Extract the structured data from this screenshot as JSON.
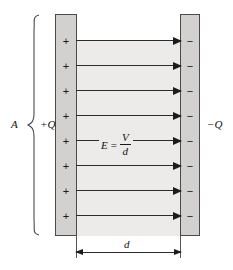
{
  "figure": {
    "type": "diagram",
    "background_color": "#ffffff"
  },
  "colors": {
    "plate_fill": "#d2d1cf",
    "plate_stroke": "#4a4a4a",
    "field_region_fill": "#edebe9",
    "line": "#2b2b2b",
    "text": "#111111"
  },
  "plates": {
    "positive": {
      "charge_label": "+Q",
      "charge_symbol": "+",
      "charge_count": 8,
      "area_label": "A"
    },
    "negative": {
      "charge_label": "−Q",
      "charge_symbol": "−",
      "charge_count": 8
    }
  },
  "field": {
    "arrow_count": 8,
    "direction": "left-to-right",
    "equation": {
      "symbol": "E",
      "operator": "=",
      "numerator": "V",
      "denominator": "d",
      "full_text": "E = V/d"
    }
  },
  "dimension": {
    "label": "d",
    "description": "plate separation"
  }
}
